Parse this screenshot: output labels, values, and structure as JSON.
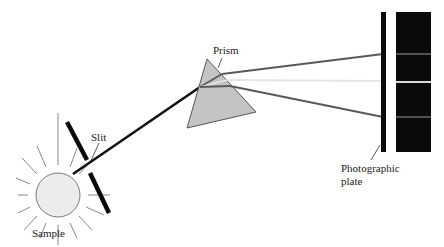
{
  "labels": {
    "sample": "Sample",
    "slit": "Slit",
    "prism": "Prism",
    "plate_line1": "Photographic",
    "plate_line2": "plate"
  },
  "colors": {
    "incident_beam": "#111111",
    "ray_upper": "#5a5a5a",
    "ray_middle": "#e6e6e6",
    "ray_lower": "#5a5a5a",
    "prism_fill": "#c4c4c4",
    "sample_fill": "#ececec",
    "plate": "#0a0a0a",
    "spectrum_bg": "#0a0a0a",
    "spectrum_line_gray": "#6a6a6a",
    "spectrum_line_light": "#d8d8d8"
  }
}
